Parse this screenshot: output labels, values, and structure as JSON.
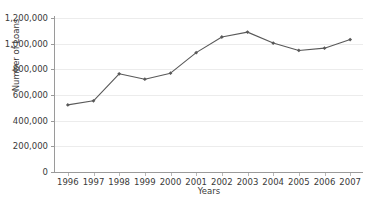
{
  "chart_data": {
    "type": "line",
    "title": "",
    "xlabel": "Years",
    "ylabel": "Number of Loans",
    "categories": [
      "1996",
      "1997",
      "1998",
      "1999",
      "2000",
      "2001",
      "2002",
      "2003",
      "2004",
      "2005",
      "2006",
      "2007"
    ],
    "values": [
      523000,
      555000,
      765000,
      723000,
      770000,
      930000,
      1052000,
      1090000,
      1005000,
      947000,
      965000,
      1032000
    ],
    "series": [
      {
        "name": "Number of Loans",
        "values": [
          523000,
          555000,
          765000,
          723000,
          770000,
          930000,
          1052000,
          1090000,
          1005000,
          947000,
          965000,
          1032000
        ]
      }
    ],
    "ylim": [
      0,
      1200000
    ],
    "ytick_values": [
      0,
      200000,
      400000,
      600000,
      800000,
      1000000,
      1200000
    ],
    "ytick_labels": [
      "0",
      "200,000",
      "400,000",
      "600,000",
      "800,000",
      "1,000,000",
      "1,200,000"
    ],
    "grid": true,
    "legend": "none",
    "line_color": "#595959",
    "marker_color": "#595959",
    "gridline_color": "#ececec",
    "axis_color": "#9a9a9a",
    "background_color": "#ffffff"
  }
}
